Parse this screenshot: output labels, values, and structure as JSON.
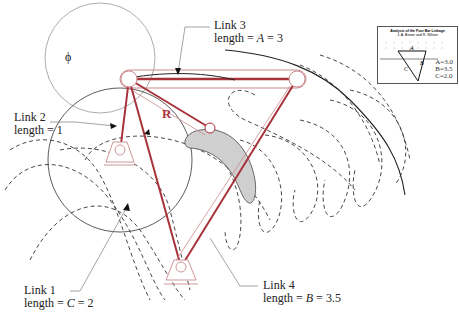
{
  "figure": {
    "type": "four-bar linkage diagram",
    "colors": {
      "link": "#a8323a",
      "link_outline": "#c98a8e",
      "curve": "#222222",
      "fill_gray": "#cfcfcf"
    }
  },
  "labels": {
    "link3": {
      "line1": "Link 3",
      "line2_prefix": "length = ",
      "var": "A",
      "line2_suffix": " = 3"
    },
    "link2": {
      "line1": "Link 2",
      "line2": "length  = 1"
    },
    "link1": {
      "line1": "Link 1",
      "line2_prefix": "length = ",
      "var": "C",
      "line2_suffix": " = 2"
    },
    "link4": {
      "line1": "Link 4",
      "line2_prefix": "length = ",
      "var": "B",
      "line2_suffix": " = 3.5"
    },
    "phi": "ϕ",
    "R": "R"
  },
  "inset": {
    "title_line1": "Analysis of the Four Bar Linkage",
    "title_line2": "J. A. Brown and R. Wilson",
    "A": "A=3.0",
    "B": "B=3.5",
    "C": "C=2.0",
    "label_A": "A",
    "label_B": "B",
    "label_C": "C"
  }
}
